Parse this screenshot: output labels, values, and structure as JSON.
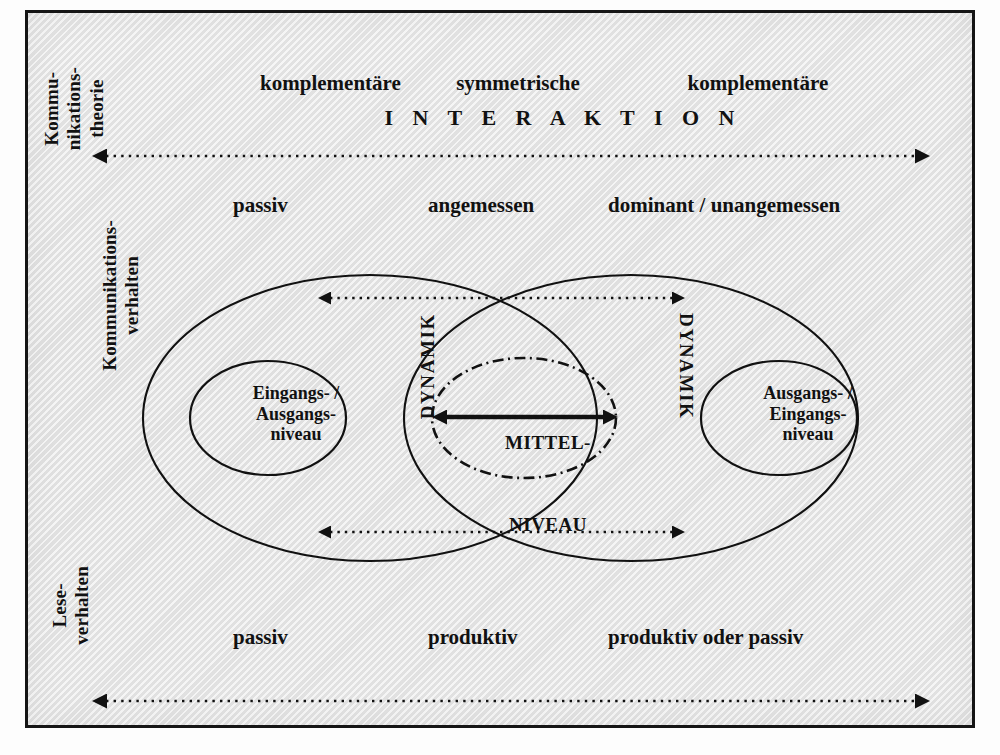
{
  "diagram": {
    "title_row": {
      "left": "komplementäre",
      "center": "symmetrische",
      "right": "komplementäre",
      "banner": "I N T E R A K T I O N"
    },
    "margin_labels": {
      "kommunikationstheorie": "Kommu-\nnikations-\ntheorie",
      "kommunikationsverhalten": "Kommunikations-\nverhalten",
      "leseverhalten": "Lese-\nverhalten"
    },
    "kommunikationsverhalten_row": {
      "left": "passiv",
      "center": "angemessen",
      "right": "dominant / unangemessen"
    },
    "leseverhalten_row": {
      "left": "passiv",
      "center": "produktiv",
      "right": "produktiv oder passiv"
    },
    "ellipses": {
      "left_inner": "Eingangs- /\nAusgangs-\nniveau",
      "right_inner": "Ausgangs- /\nEingangs-\nniveau",
      "center_line1": "MITTEL-",
      "center_line2": "NIVEAU"
    },
    "dynamics": {
      "left": "DYNAMIK",
      "right": "DYNAMIK"
    },
    "colors": {
      "ink": "#111111",
      "paper": "#e8e8e8",
      "frame": "#151515"
    }
  }
}
